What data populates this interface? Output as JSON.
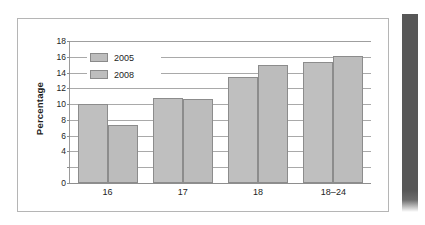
{
  "figure": {
    "frame_border_color": "#b5b5b5",
    "background_color": "#ffffff",
    "page_edge_color": "#575757"
  },
  "chart_data": {
    "type": "bar",
    "title": "",
    "subtitle": "",
    "xlabel": "",
    "ylabel": "Percentage",
    "categories": [
      "16",
      "17",
      "18",
      "18–24"
    ],
    "series": [
      {
        "name": "2005",
        "values": [
          10.0,
          10.8,
          13.5,
          15.3
        ],
        "color": "#bfbfbf"
      },
      {
        "name": "2008",
        "values": [
          7.3,
          10.6,
          15.0,
          16.1
        ],
        "color": "#bcbcbc"
      }
    ],
    "ylim": [
      0,
      18
    ],
    "ytick_values": [
      0,
      2,
      4,
      6,
      8,
      10,
      12,
      14,
      16,
      18
    ],
    "ytick_labels": [
      "0",
      "",
      "4",
      "6",
      "8",
      "10",
      "12",
      "14",
      "16",
      "18"
    ],
    "grid": true,
    "grid_axis": "y",
    "legend_position": "upper-left-inside",
    "legend_entries": [
      "2005",
      "2008"
    ],
    "annotations": []
  }
}
